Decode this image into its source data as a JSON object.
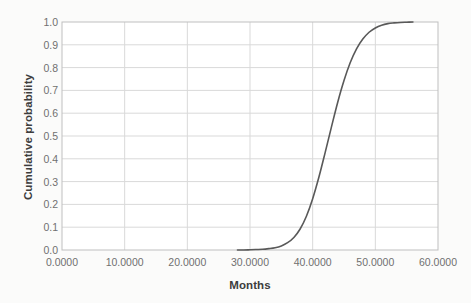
{
  "chart_data": {
    "type": "line",
    "title": "",
    "subtitle": "",
    "xlabel": "Months",
    "ylabel": "Cumulative probability",
    "xlim": [
      0,
      60
    ],
    "ylim": [
      0,
      1
    ],
    "grid": true,
    "legend": null,
    "legend_position": "none",
    "line_color": "#595959",
    "line_width": 1.6,
    "x_tick_labels": [
      "0.0000",
      "10.0000",
      "20.0000",
      "30.0000",
      "40.0000",
      "50.0000",
      "60.0000"
    ],
    "x_ticks": [
      0,
      10,
      20,
      30,
      40,
      50,
      60
    ],
    "y_tick_labels": [
      "0.0",
      "0.1",
      "0.2",
      "0.3",
      "0.4",
      "0.5",
      "0.6",
      "0.7",
      "0.8",
      "0.9",
      "1.0"
    ],
    "y_ticks": [
      0,
      0.1,
      0.2,
      0.3,
      0.4,
      0.5,
      0.6,
      0.7,
      0.8,
      0.9,
      1.0
    ],
    "series": [
      {
        "name": "Cumulative probability",
        "x": [
          28.0,
          29.0,
          30.0,
          31.0,
          32.0,
          33.0,
          34.0,
          35.0,
          36.0,
          37.0,
          38.0,
          39.0,
          40.0,
          41.0,
          42.0,
          43.0,
          44.0,
          45.0,
          46.0,
          47.0,
          48.0,
          49.0,
          50.0,
          51.0,
          52.0,
          53.0,
          54.0,
          55.0,
          56.0
        ],
        "y": [
          0.0,
          0.0,
          0.001,
          0.002,
          0.003,
          0.006,
          0.01,
          0.018,
          0.032,
          0.055,
          0.092,
          0.148,
          0.225,
          0.32,
          0.428,
          0.54,
          0.648,
          0.743,
          0.822,
          0.882,
          0.925,
          0.955,
          0.974,
          0.986,
          0.993,
          0.996,
          0.998,
          0.999,
          1.0
        ]
      }
    ]
  },
  "axes": {
    "x_title": "Months",
    "y_title": "Cumulative probability"
  },
  "colors": {
    "background": "#fbfbfa",
    "plot_background": "#ffffff",
    "grid": "#d9d9d9",
    "axis": "#bfbfbf",
    "line": "#595959",
    "tick_text": "#707070",
    "title_text": "#3d3d3d"
  }
}
